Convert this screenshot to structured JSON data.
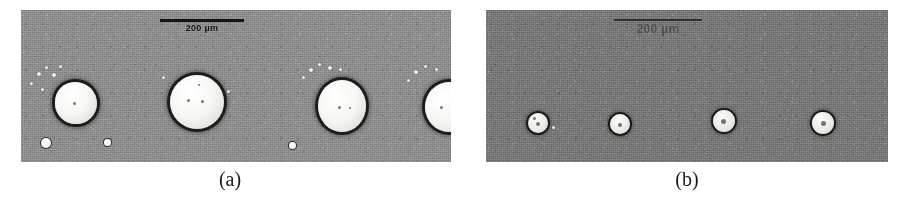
{
  "figure": {
    "background_color": "#ffffff",
    "panels": [
      {
        "id": "a",
        "caption": "(a)",
        "background_color": "#8b8b8b",
        "scalebar": {
          "label": "200 µm",
          "length_px": 84,
          "color": "#151515"
        },
        "droplet_count": 4,
        "droplets": [
          {
            "cx": 55,
            "cy": 93,
            "r": 21
          },
          {
            "cx": 176,
            "cy": 92,
            "r": 27
          },
          {
            "cx": 321,
            "cy": 95,
            "r": 25
          },
          {
            "cx": 428,
            "cy": 96,
            "r": 24
          }
        ],
        "satellites": [
          {
            "cx": 25,
            "cy": 133,
            "r": 5
          },
          {
            "cx": 87,
            "cy": 133,
            "r": 4
          },
          {
            "cx": 272,
            "cy": 136,
            "r": 4
          }
        ]
      },
      {
        "id": "b",
        "caption": "(b)",
        "background_color": "#767676",
        "scalebar": {
          "label": "200 µm",
          "length_px": 88,
          "color": "#2b2b2b"
        },
        "droplet_count": 4,
        "droplets": [
          {
            "cx": 52,
            "cy": 113,
            "r": 10
          },
          {
            "cx": 134,
            "cy": 114,
            "r": 10
          },
          {
            "cx": 238,
            "cy": 111,
            "r": 11
          },
          {
            "cx": 337,
            "cy": 113,
            "r": 11
          }
        ],
        "satellites": []
      }
    ]
  }
}
